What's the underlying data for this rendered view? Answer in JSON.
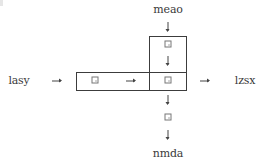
{
  "diagram": {
    "type": "block-flow",
    "labels": {
      "top": "meao",
      "left": "lasy",
      "right": "lzsx",
      "bottom": "nmda"
    },
    "nodes": [
      {
        "id": "n-left",
        "glyph": "square-icon",
        "region": "horizontal-box-left-cell"
      },
      {
        "id": "n-top",
        "glyph": "square-icon",
        "region": "vertical-box-top-cell"
      },
      {
        "id": "n-center",
        "glyph": "square-icon",
        "region": "intersection-cell"
      },
      {
        "id": "n-bottom",
        "glyph": "square-icon",
        "region": "below-boxes"
      }
    ],
    "edges": [
      {
        "from": "meao",
        "to": "n-top"
      },
      {
        "from": "n-top",
        "to": "n-center"
      },
      {
        "from": "lasy",
        "to": "n-left"
      },
      {
        "from": "n-left",
        "to": "n-center"
      },
      {
        "from": "n-center",
        "to": "lzsx"
      },
      {
        "from": "n-center",
        "to": "n-bottom"
      },
      {
        "from": "n-bottom",
        "to": "nmda"
      }
    ],
    "colors": {
      "line": "#3c3c3c",
      "text": "#3a3a3a",
      "background": "#ffffff"
    }
  }
}
